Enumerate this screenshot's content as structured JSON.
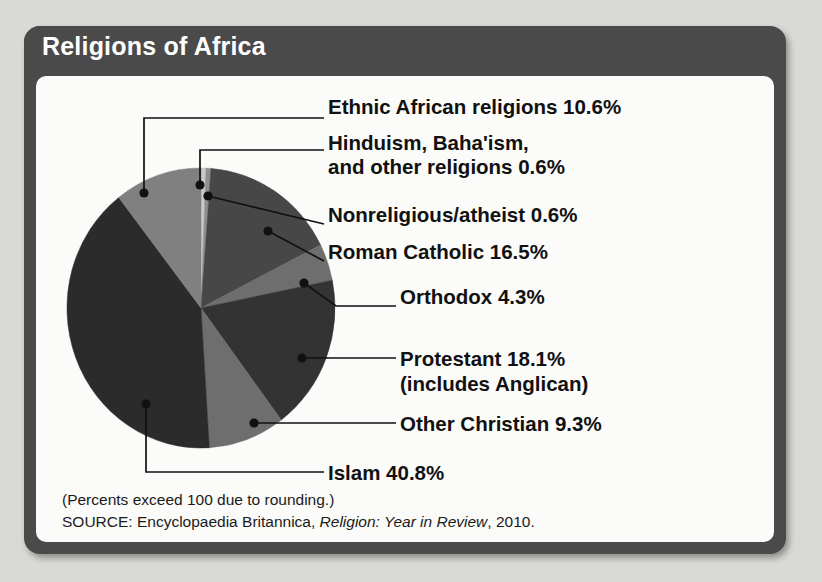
{
  "title": "Religions of Africa",
  "colors": {
    "frame": "#4a4a4a",
    "panel": "#fbfbf9",
    "page_background": "#d9d9d6",
    "title_text": "#ffffff",
    "label_text": "#111111",
    "leader_line": "#111111"
  },
  "chart_data": {
    "type": "pie",
    "title": "Religions of Africa",
    "xlabel": "",
    "ylabel": "",
    "unit": "%",
    "legend_position": "callout-labels-right",
    "start_angle_deg": 0,
    "direction": "clockwise",
    "note": "Percents exceed 100 due to rounding.",
    "categories": [
      "Hinduism, Baha'ism, and other religions",
      "Nonreligious/atheist",
      "Roman Catholic",
      "Orthodox",
      "Protestant",
      "Other Christian",
      "Islam",
      "Ethnic African religions"
    ],
    "values": [
      0.6,
      0.6,
      16.5,
      4.3,
      18.1,
      9.3,
      40.8,
      10.6
    ],
    "total": 100.8,
    "slices": [
      {
        "label": "Hinduism, Baha'ism, and other religions",
        "value": 0.6,
        "pct_text": "0.6%",
        "color": "#c9c9c9"
      },
      {
        "label": "Nonreligious/atheist",
        "value": 0.6,
        "pct_text": "0.6%",
        "color": "#8f8f8f"
      },
      {
        "label": "Roman Catholic",
        "value": 16.5,
        "pct_text": "16.5%",
        "color": "#474747"
      },
      {
        "label": "Orthodox",
        "value": 4.3,
        "pct_text": "4.3%",
        "color": "#6e6e6e"
      },
      {
        "label": "Protestant",
        "value": 18.1,
        "pct_text": "18.1%",
        "color": "#333333"
      },
      {
        "label": "Other Christian",
        "value": 9.3,
        "pct_text": "9.3%",
        "color": "#6e6e6e"
      },
      {
        "label": "Islam",
        "value": 40.8,
        "pct_text": "40.8%",
        "color": "#2b2b2b"
      },
      {
        "label": "Ethnic African religions",
        "value": 10.6,
        "pct_text": "10.6%",
        "color": "#808080"
      }
    ]
  },
  "labels": {
    "ethnic": "Ethnic African religions  10.6%",
    "hinduism_line1": "Hinduism, Baha'ism,",
    "hinduism_line2": "and other religions  0.6%",
    "nonreligious": "Nonreligious/atheist  0.6%",
    "roman_catholic": "Roman Catholic  16.5%",
    "orthodox": "Orthodox  4.3%",
    "protestant_line1": "Protestant  18.1%",
    "protestant_line2": "(includes Anglican)",
    "other_christian": "Other Christian  9.3%",
    "islam": "Islam  40.8%"
  },
  "footer": {
    "rounding_note": "(Percents exceed 100 due to rounding.)",
    "source_prefix": "SOURCE: Encyclopaedia Britannica, ",
    "source_italic": "Religion: Year in Review",
    "source_suffix": ", 2010."
  }
}
